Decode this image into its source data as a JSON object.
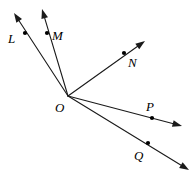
{
  "figure": {
    "type": "geometry-ray-diagram",
    "background_color": "#ffffff",
    "stroke_color": "#1a1a1a",
    "label_color": "#000000",
    "width": 194,
    "height": 175,
    "vertex": {
      "label": "O",
      "name": "vertex-o",
      "x": 68,
      "y": 96,
      "label_x": 55,
      "label_y": 112,
      "has_dot": false
    },
    "rays": [
      {
        "label": "L",
        "name": "ray-ol",
        "point_x": 25,
        "point_y": 33,
        "label_x": 8,
        "label_y": 43,
        "tip_x": 14,
        "tip_y": 13,
        "angle_deg": 119.0
      },
      {
        "label": "M",
        "name": "ray-om",
        "point_x": 47,
        "point_y": 33,
        "label_x": 52,
        "label_y": 40,
        "tip_x": 42,
        "tip_y": 9,
        "angle_deg": 108.4
      },
      {
        "label": "N",
        "name": "ray-on",
        "point_x": 124,
        "point_y": 53,
        "label_x": 128,
        "label_y": 67,
        "tip_x": 145,
        "tip_y": 41,
        "angle_deg": 35.7
      },
      {
        "label": "P",
        "name": "ray-op",
        "point_x": 152,
        "point_y": 118,
        "label_x": 146,
        "label_y": 111,
        "tip_x": 182,
        "tip_y": 126,
        "angle_deg": -13.1
      },
      {
        "label": "Q",
        "name": "ray-oq",
        "point_x": 148,
        "point_y": 143,
        "label_x": 134,
        "label_y": 160,
        "tip_x": 189,
        "tip_y": 170,
        "angle_deg": -30.8
      }
    ]
  }
}
